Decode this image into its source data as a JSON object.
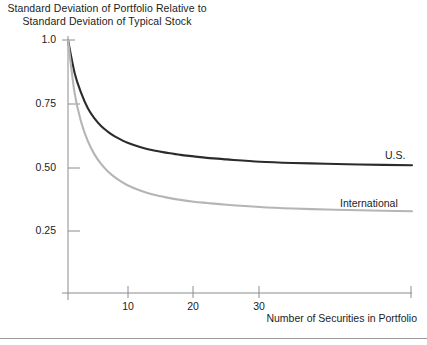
{
  "chart_data": {
    "type": "line",
    "title": "Standard Deviation of Portfolio Relative to Standard Deviation of Typical Stock",
    "title_line1": "Standard Deviation of Portfolio Relative to",
    "title_line2": "Standard Deviation of Typical Stock",
    "xlabel": "Number of Securities in Portfolio",
    "ylabel": "",
    "xlim": [
      1,
      53
    ],
    "ylim": [
      0,
      1.0
    ],
    "grid": false,
    "legend_position": "inline-right",
    "y_ticks": [
      {
        "value": 1.0,
        "label": "1.0"
      },
      {
        "value": 0.75,
        "label": "0.75"
      },
      {
        "value": 0.5,
        "label": "0.50"
      },
      {
        "value": 0.25,
        "label": "0.25"
      }
    ],
    "x_ticks": [
      {
        "value": 10,
        "label": "10"
      },
      {
        "value": 20,
        "label": "20"
      },
      {
        "value": 30,
        "label": "30"
      }
    ],
    "x": [
      1,
      2,
      3,
      4,
      5,
      6,
      7,
      8,
      9,
      10,
      12,
      14,
      16,
      18,
      20,
      22,
      25,
      30,
      35,
      40,
      45,
      53
    ],
    "series": [
      {
        "name": "U.S.",
        "color": "#2b2b2b",
        "asymptote": 0.5,
        "values": [
          1.0,
          0.87,
          0.79,
          0.73,
          0.69,
          0.66,
          0.638,
          0.62,
          0.606,
          0.594,
          0.576,
          0.563,
          0.554,
          0.546,
          0.54,
          0.534,
          0.528,
          0.519,
          0.514,
          0.511,
          0.508,
          0.505
        ]
      },
      {
        "name": "International",
        "color": "#b5b5b5",
        "asymptote": 0.31,
        "values": [
          1.0,
          0.79,
          0.675,
          0.6,
          0.548,
          0.51,
          0.481,
          0.459,
          0.441,
          0.426,
          0.404,
          0.388,
          0.377,
          0.368,
          0.361,
          0.356,
          0.349,
          0.34,
          0.334,
          0.33,
          0.327,
          0.323
        ]
      }
    ]
  },
  "axis_geometry": {
    "left": 68,
    "right": 412,
    "top": 40,
    "bottom": 293
  }
}
